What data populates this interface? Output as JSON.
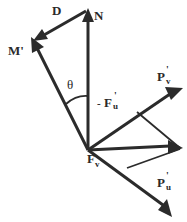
{
  "diagram": {
    "type": "vector force diagram",
    "labels": {
      "D": "D",
      "N": "N",
      "M": "M'",
      "theta": "θ",
      "Fu_prefix": "-",
      "Fu": "F",
      "Fu_sup": "'",
      "Fu_sub": "u",
      "Pv": "P",
      "Pv_sup": "'",
      "Pv_sub": "v",
      "Fv": "F",
      "Fv_sup": "'",
      "Fv_sub": "v",
      "Pu": "P",
      "Pu_sup": "'",
      "Pu_sub": "u"
    },
    "vectors": [
      {
        "name": "N",
        "description": "vertical vector upward from origin"
      },
      {
        "name": "M'",
        "description": "vector up-left from origin"
      },
      {
        "name": "D",
        "description": "vector from tip of N to tip of M'"
      },
      {
        "name": "P'v",
        "description": "vector up-right from origin"
      },
      {
        "name": "P'u",
        "description": "vector down-right from origin along M' line"
      },
      {
        "name": "resultant",
        "description": "vector right from origin, diagonal of parallelogram of P'v and P'u"
      }
    ],
    "angle": "θ between N and M'",
    "colors": {
      "ink": "#2b2b2b",
      "background": "#ffffff"
    }
  }
}
